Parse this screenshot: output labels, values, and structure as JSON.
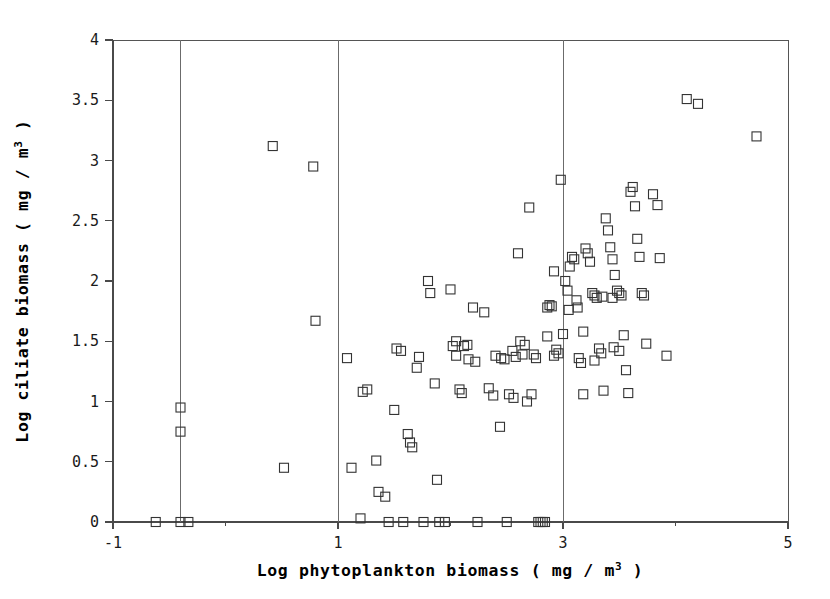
{
  "chart_data": {
    "type": "scatter",
    "title": "",
    "xlabel": "Log phytoplankton biomass ( mg / m3 )",
    "xlabel_base": "Log phytoplankton biomass ( mg / m",
    "xlabel_sup": "3",
    "xlabel_tail": " )",
    "ylabel": "Log ciliate biomass ( mg / m3 )",
    "ylabel_base": "Log ciliate biomass ( mg / m",
    "ylabel_sup": "3",
    "ylabel_tail": " )",
    "xlim": [
      -1,
      5
    ],
    "ylim": [
      0,
      4
    ],
    "xticks": [
      -1,
      1,
      3,
      5
    ],
    "xtick_labels": [
      "-1",
      "1",
      "3",
      "5"
    ],
    "yticks": [
      0,
      0.5,
      1,
      1.5,
      2,
      2.5,
      3,
      3.5,
      4
    ],
    "ytick_labels": [
      "0",
      "0.5",
      "1",
      "1.5",
      "2",
      "2.5",
      "3",
      "3.5",
      "4"
    ],
    "xminor_ticks": [
      0,
      2,
      4
    ],
    "grid": false,
    "legend": false,
    "marker": "open-square",
    "marker_color": "#333333",
    "marker_size": 9,
    "vertical_reference_line_x": -0.4,
    "points": [
      [
        -0.4,
        0.95
      ],
      [
        -0.4,
        0.75
      ],
      [
        -0.4,
        0.0
      ],
      [
        -0.33,
        0.0
      ],
      [
        -0.62,
        0.0
      ],
      [
        0.42,
        3.12
      ],
      [
        0.52,
        0.45
      ],
      [
        0.78,
        2.95
      ],
      [
        0.8,
        1.67
      ],
      [
        1.08,
        1.36
      ],
      [
        1.12,
        0.45
      ],
      [
        1.2,
        0.03
      ],
      [
        1.22,
        1.08
      ],
      [
        1.26,
        1.1
      ],
      [
        1.34,
        0.51
      ],
      [
        1.36,
        0.25
      ],
      [
        1.42,
        0.21
      ],
      [
        1.45,
        0.0
      ],
      [
        1.5,
        0.93
      ],
      [
        1.52,
        1.44
      ],
      [
        1.56,
        1.42
      ],
      [
        1.58,
        0.0
      ],
      [
        1.62,
        0.73
      ],
      [
        1.64,
        0.66
      ],
      [
        1.66,
        0.62
      ],
      [
        1.7,
        1.28
      ],
      [
        1.72,
        1.37
      ],
      [
        1.76,
        0.0
      ],
      [
        1.8,
        2.0
      ],
      [
        1.82,
        1.9
      ],
      [
        1.86,
        1.15
      ],
      [
        1.88,
        0.35
      ],
      [
        1.9,
        0.0
      ],
      [
        1.95,
        0.0
      ],
      [
        2.0,
        1.93
      ],
      [
        2.02,
        1.46
      ],
      [
        2.05,
        1.38
      ],
      [
        2.08,
        1.1
      ],
      [
        2.1,
        1.07
      ],
      [
        2.12,
        1.46
      ],
      [
        2.16,
        1.35
      ],
      [
        2.2,
        1.78
      ],
      [
        2.22,
        1.33
      ],
      [
        2.24,
        0.0
      ],
      [
        2.3,
        1.74
      ],
      [
        2.34,
        1.11
      ],
      [
        2.38,
        1.05
      ],
      [
        2.4,
        1.38
      ],
      [
        2.44,
        0.79
      ],
      [
        2.48,
        1.35
      ],
      [
        2.5,
        0.0
      ],
      [
        2.55,
        1.42
      ],
      [
        2.58,
        1.37
      ],
      [
        2.6,
        2.23
      ],
      [
        2.62,
        1.5
      ],
      [
        2.66,
        1.47
      ],
      [
        2.68,
        1.0
      ],
      [
        2.7,
        2.61
      ],
      [
        2.72,
        1.06
      ],
      [
        2.74,
        1.39
      ],
      [
        2.76,
        1.36
      ],
      [
        2.78,
        0.0
      ],
      [
        2.8,
        0.0
      ],
      [
        2.82,
        0.0
      ],
      [
        2.84,
        0.0
      ],
      [
        2.86,
        1.78
      ],
      [
        2.88,
        1.8
      ],
      [
        2.9,
        1.79
      ],
      [
        2.92,
        1.38
      ],
      [
        2.94,
        1.43
      ],
      [
        2.96,
        1.4
      ],
      [
        2.98,
        2.84
      ],
      [
        3.0,
        1.56
      ],
      [
        3.02,
        2.0
      ],
      [
        3.04,
        1.92
      ],
      [
        3.06,
        2.12
      ],
      [
        3.08,
        2.2
      ],
      [
        3.1,
        2.18
      ],
      [
        3.12,
        1.84
      ],
      [
        3.14,
        1.36
      ],
      [
        3.16,
        1.32
      ],
      [
        3.18,
        1.06
      ],
      [
        3.2,
        2.27
      ],
      [
        3.22,
        2.23
      ],
      [
        3.24,
        2.16
      ],
      [
        3.26,
        1.9
      ],
      [
        3.28,
        1.88
      ],
      [
        3.3,
        1.86
      ],
      [
        3.32,
        1.44
      ],
      [
        3.34,
        1.4
      ],
      [
        3.36,
        1.09
      ],
      [
        3.38,
        2.52
      ],
      [
        3.4,
        2.42
      ],
      [
        3.42,
        2.28
      ],
      [
        3.44,
        2.18
      ],
      [
        3.46,
        2.05
      ],
      [
        3.48,
        1.92
      ],
      [
        3.5,
        1.9
      ],
      [
        3.52,
        1.88
      ],
      [
        3.54,
        1.55
      ],
      [
        3.56,
        1.26
      ],
      [
        3.58,
        1.07
      ],
      [
        3.6,
        2.74
      ],
      [
        3.62,
        2.78
      ],
      [
        3.64,
        2.62
      ],
      [
        3.66,
        2.35
      ],
      [
        3.68,
        2.2
      ],
      [
        3.7,
        1.9
      ],
      [
        3.72,
        1.88
      ],
      [
        3.74,
        1.48
      ],
      [
        3.8,
        2.72
      ],
      [
        3.84,
        2.63
      ],
      [
        3.86,
        2.19
      ],
      [
        3.92,
        1.38
      ],
      [
        4.1,
        3.51
      ],
      [
        4.2,
        3.47
      ],
      [
        4.72,
        3.2
      ],
      [
        2.05,
        1.5
      ],
      [
        2.15,
        1.47
      ],
      [
        2.45,
        1.36
      ],
      [
        2.52,
        1.06
      ],
      [
        3.05,
        1.76
      ],
      [
        3.13,
        1.78
      ],
      [
        3.35,
        1.87
      ],
      [
        3.45,
        1.45
      ],
      [
        2.92,
        2.08
      ],
      [
        2.86,
        1.54
      ],
      [
        3.18,
        1.58
      ],
      [
        3.28,
        1.34
      ],
      [
        2.64,
        1.39
      ],
      [
        2.56,
        1.03
      ],
      [
        3.44,
        1.86
      ],
      [
        3.5,
        1.42
      ]
    ],
    "n_points": 136
  },
  "axes": {
    "frame_color": "#555555",
    "tick_color": "#4a4a4a"
  }
}
